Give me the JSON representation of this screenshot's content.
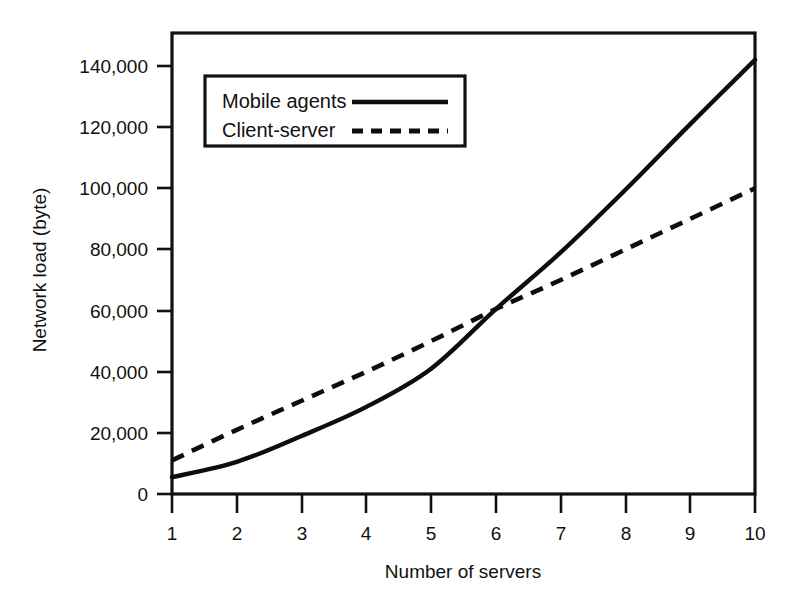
{
  "chart_data": {
    "type": "line",
    "title": "",
    "xlabel": "Number of servers",
    "ylabel": "Network load (byte)",
    "xlim": [
      1,
      10
    ],
    "ylim": [
      0,
      150000
    ],
    "grid": false,
    "legend_position": "top-left-inside",
    "x": [
      1,
      2,
      3,
      4,
      5,
      6,
      7,
      8,
      9,
      10
    ],
    "xticks": [
      "1",
      "2",
      "3",
      "4",
      "5",
      "6",
      "7",
      "8",
      "9",
      "10"
    ],
    "yticks": [
      "0",
      "20,000",
      "40,000",
      "60,000",
      "80,000",
      "100,000",
      "120,000",
      "140,000"
    ],
    "ytick_values": [
      0,
      20000,
      40000,
      60000,
      80000,
      100000,
      120000,
      140000
    ],
    "series": [
      {
        "name": "Mobile agents",
        "style": "solid",
        "color": "#0d0d0d",
        "values": [
          5500,
          10500,
          19000,
          28500,
          41000,
          60500,
          79000,
          99500,
          121000,
          142000
        ]
      },
      {
        "name": "Client-server",
        "style": "dashed",
        "color": "#0d0d0d",
        "values": [
          11000,
          21000,
          30500,
          40000,
          50000,
          60500,
          70000,
          80000,
          90000,
          100000
        ]
      }
    ]
  },
  "axes": {
    "x_title": "Number of servers",
    "y_title": "Network load (byte)"
  },
  "legend": {
    "entries": [
      {
        "label": "Mobile agents",
        "style": "solid"
      },
      {
        "label": "Client-server",
        "style": "dashed"
      }
    ]
  }
}
